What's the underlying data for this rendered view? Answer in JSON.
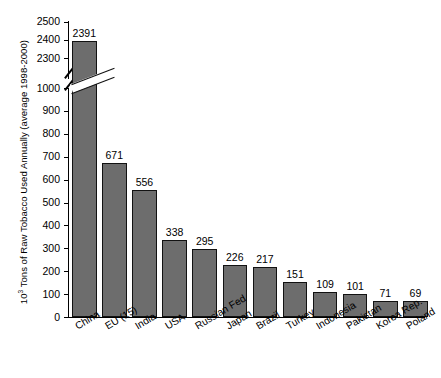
{
  "chart_data": {
    "type": "bar",
    "title": "",
    "xlabel": "",
    "ylabel_prefix": "10",
    "ylabel_sup": "3",
    "ylabel_rest": " Tons of Raw Tobacco Used Annually (average 1998-2000)",
    "ylabel_full": "10^3 Tons of Raw Tobacco Used Annually (average 1998-2000)",
    "categories": [
      "China",
      "EU (15)",
      "India",
      "USA",
      "Russian Fed",
      "Japan",
      "Brazil",
      "Turkey",
      "Indonesia",
      "Pakistan",
      "Korea Rep.",
      "Poland"
    ],
    "values": [
      2391,
      671,
      556,
      338,
      295,
      226,
      217,
      151,
      109,
      101,
      71,
      69
    ],
    "value_labels": [
      "2391",
      "671",
      "556",
      "338",
      "295",
      "226",
      "217",
      "151",
      "109",
      "101",
      "71",
      "69"
    ],
    "ytick_labels_lower": [
      "0",
      "100",
      "200",
      "300",
      "400",
      "500",
      "600",
      "700",
      "800",
      "900",
      "1000"
    ],
    "ytick_values_lower": [
      0,
      100,
      200,
      300,
      400,
      500,
      600,
      700,
      800,
      900,
      1000
    ],
    "ytick_labels_upper": [
      "2300",
      "2400",
      "2500"
    ],
    "ytick_values_upper": [
      2300,
      2400,
      2500
    ],
    "axis_break": true,
    "axis_break_between": [
      1000,
      2300
    ],
    "ylim_lower": [
      0,
      1000
    ],
    "ylim_upper": [
      2300,
      2500
    ],
    "grid": false,
    "legend": "none",
    "bar_fill_color": "#6d6d6d",
    "bar_edge_color": "#121212",
    "background_color": "#ffffff"
  }
}
